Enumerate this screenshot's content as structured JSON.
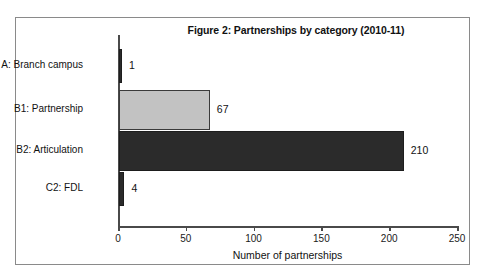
{
  "chart_data": {
    "type": "bar",
    "orientation": "horizontal",
    "title": "Figure 2: Partnerships by category (2010-11)",
    "xlabel": "Number of partnerships",
    "ylabel": "",
    "categories": [
      "A: Branch campus",
      "B1: Partnership",
      "B2: Articulation",
      "C2: FDL"
    ],
    "values": [
      1,
      67,
      210,
      4
    ],
    "value_labels": [
      "1",
      "67",
      "210",
      "4"
    ],
    "bar_colors": [
      "#2b2b2b",
      "#c2c2c2",
      "#2b2b2b",
      "#2b2b2b"
    ],
    "xlim": [
      0,
      250
    ],
    "xticks": [
      0,
      50,
      100,
      150,
      200,
      250
    ],
    "xtick_labels": [
      "0",
      "50",
      "100",
      "150",
      "200",
      "250"
    ],
    "grid": false,
    "legend": false
  },
  "frame": {
    "border_color": "#8a8a8a",
    "background": "#ffffff"
  },
  "axis": {
    "line_color": "#4a4a4a"
  }
}
